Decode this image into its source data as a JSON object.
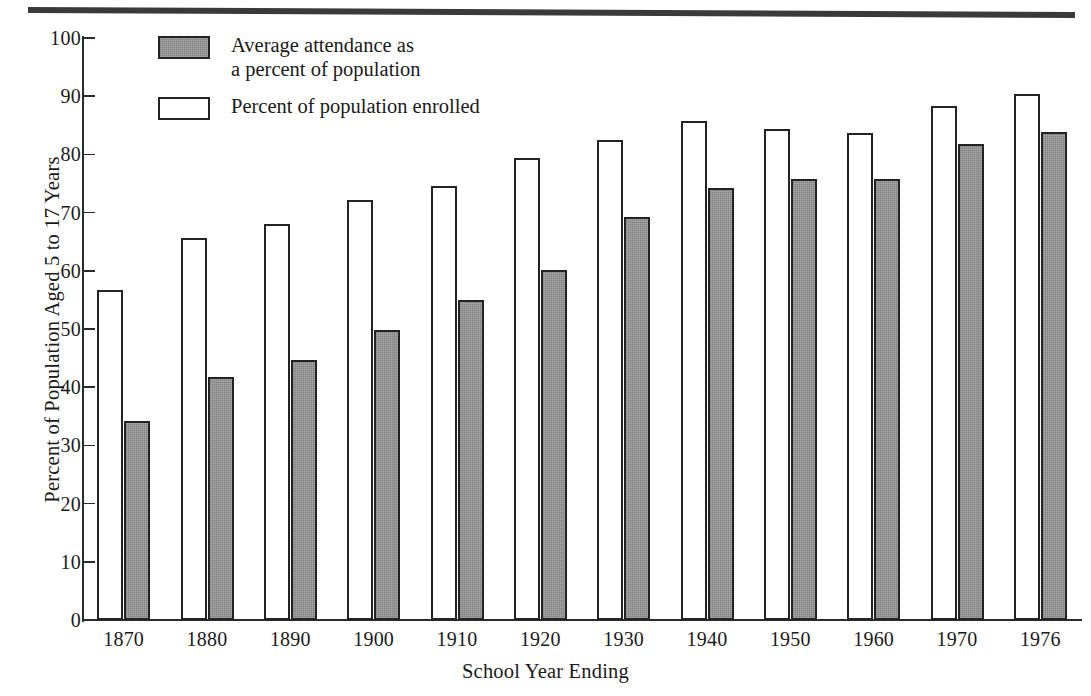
{
  "chart_data": {
    "type": "bar",
    "title": "",
    "xlabel": "School Year Ending",
    "ylabel": "Percent of Population Aged 5 to 17 Years",
    "categories": [
      "1870",
      "1880",
      "1890",
      "1900",
      "1910",
      "1920",
      "1930",
      "1940",
      "1950",
      "1960",
      "1970",
      "1976"
    ],
    "series": [
      {
        "name": "Percent of population enrolled",
        "style": "hollow",
        "color": "#ffffff",
        "values": [
          56.7,
          65.6,
          68.1,
          72.2,
          74.5,
          79.4,
          82.5,
          85.8,
          84.4,
          83.7,
          88.4,
          90.4
        ]
      },
      {
        "name": "Average attendance as\na percent of population",
        "style": "filled",
        "color": "#8c8c8c",
        "values": [
          34.2,
          41.8,
          44.7,
          49.8,
          54.9,
          60.2,
          69.3,
          74.3,
          75.8,
          75.7,
          81.8,
          83.9
        ]
      }
    ],
    "ylim": [
      0,
      100
    ],
    "yticks": [
      0,
      10,
      20,
      30,
      40,
      50,
      60,
      70,
      80,
      90,
      100
    ],
    "ytick_labels": [
      "0",
      "10",
      "20",
      "30",
      "40",
      "50",
      "60",
      "70",
      "80",
      "90",
      "100"
    ],
    "grid": false,
    "legend_position": "top-left",
    "legend": [
      {
        "label": "Average attendance as\na percent of population",
        "swatch": "filled"
      },
      {
        "label": "Percent of population enrolled",
        "swatch": "hollow"
      }
    ]
  },
  "colors": {
    "bar_outline": "#232323",
    "bar_fill_gray": "#8c8c8c",
    "bar_fill_white": "#ffffff",
    "axis": "#2b2b2b",
    "rule": "#3a3a3a",
    "text": "#1a1a1a"
  }
}
